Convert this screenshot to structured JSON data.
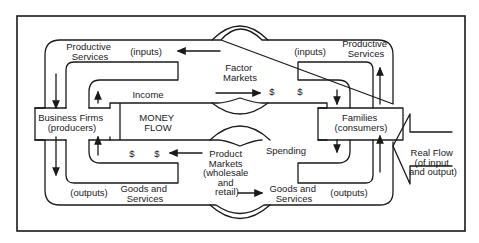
{
  "diagram": {
    "nodes": {
      "business_firms": {
        "line1": "Business Firms",
        "line2": "(producers)"
      },
      "families": {
        "line1": "Families",
        "line2": "(consumers)"
      },
      "factor_markets": {
        "line1": "Factor",
        "line2": "Markets"
      },
      "product_markets": {
        "line1": "Product",
        "line2": "Markets",
        "line3": "(wholesale",
        "line4": "and",
        "line5": "retail)"
      }
    },
    "labels": {
      "productive_services_left": {
        "line1": "Productive",
        "line2": "Services"
      },
      "inputs_left": "(inputs)",
      "inputs_right": "(inputs)",
      "productive_services_right": {
        "line1": "Productive",
        "line2": "Services"
      },
      "income": "Income",
      "money_flow": {
        "line1": "MONEY",
        "line2": "FLOW"
      },
      "dollar": "$",
      "spending": "Spending",
      "outputs_left": "(outputs)",
      "goods_services_left": {
        "line1": "Goods and",
        "line2": "Services"
      },
      "goods_services_right": {
        "line1": "Goods and",
        "line2": "Services"
      },
      "outputs_right": "(outputs)",
      "real_flow": {
        "line1": "Real Flow",
        "line2": "(of input",
        "line3": "and output)"
      }
    }
  }
}
